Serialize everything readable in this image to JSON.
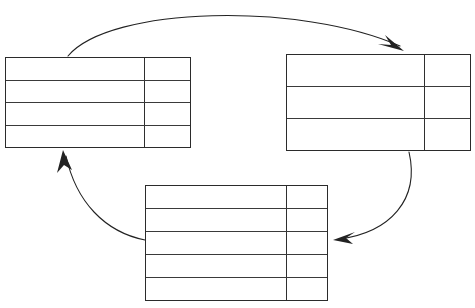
{
  "diagram": {
    "kind": "cycle-diagram",
    "title": "",
    "background_color": "#ffffff",
    "line_color": "#2b2b2b",
    "arrow_color": "#222222",
    "note": "blank worksheet: three empty tables joined in a clockwise cycle by curved arrows",
    "tables": [
      {
        "id": "table-left",
        "position": "top-left",
        "rows": 4,
        "columns": 2,
        "column_split_x": 139,
        "cells": [
          {
            "main": "",
            "side": ""
          },
          {
            "main": "",
            "side": ""
          },
          {
            "main": "",
            "side": ""
          },
          {
            "main": "",
            "side": ""
          }
        ]
      },
      {
        "id": "table-right",
        "position": "top-right",
        "rows": 3,
        "columns": 2,
        "column_split_x": 138,
        "cells": [
          {
            "main": "",
            "side": ""
          },
          {
            "main": "",
            "side": ""
          },
          {
            "main": "",
            "side": ""
          }
        ]
      },
      {
        "id": "table-bottom",
        "position": "bottom-center",
        "rows": 5,
        "columns": 2,
        "column_split_x": 141,
        "cells": [
          {
            "main": "",
            "side": ""
          },
          {
            "main": "",
            "side": ""
          },
          {
            "main": "",
            "side": ""
          },
          {
            "main": "",
            "side": ""
          },
          {
            "main": "",
            "side": ""
          }
        ]
      }
    ],
    "arrows": [
      {
        "id": "arrow-left-to-right",
        "label": "",
        "from": "table-left",
        "to": "table-right",
        "style": "curved-arc",
        "direction": "clockwise"
      },
      {
        "id": "arrow-right-to-bottom",
        "label": "",
        "from": "table-right",
        "to": "table-bottom",
        "style": "curved-arc",
        "direction": "clockwise"
      },
      {
        "id": "arrow-bottom-to-left",
        "label": "",
        "from": "table-bottom",
        "to": "table-left",
        "style": "curved-arc",
        "direction": "clockwise"
      }
    ]
  }
}
